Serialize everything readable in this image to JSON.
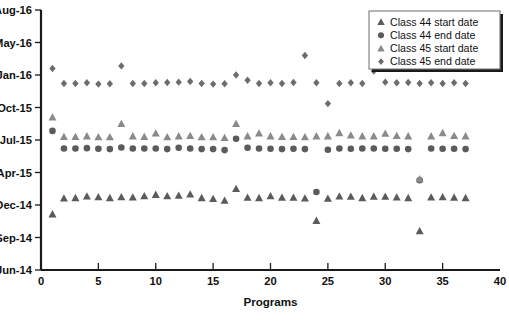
{
  "chart_data": {
    "type": "scatter",
    "title": "",
    "xlabel": "Programs",
    "ylabel": "",
    "xlim": [
      0,
      40
    ],
    "xticks": [
      0,
      5,
      10,
      15,
      20,
      25,
      30,
      35,
      40
    ],
    "xtick_labels": [
      "0",
      "5",
      "10",
      "15",
      "20",
      "25",
      "30",
      "35",
      "40"
    ],
    "yticks": [
      "Jun-14",
      "Sep-14",
      "Dec-14",
      "Apr-15",
      "Jul-15",
      "Oct-15",
      "Jan-16",
      "May-16",
      "Aug-16"
    ],
    "ytick_labels": [
      "Jun-14",
      "Sep-14",
      "Dec-14",
      "Apr-15",
      "Jul-15",
      "Oct-15",
      "Jan-16",
      "May-16",
      "Aug-16"
    ],
    "ylim_index": [
      0,
      8
    ],
    "grid": false,
    "legend_position": "top-right",
    "series": [
      {
        "name": "Class 44 start date",
        "marker": "triangle",
        "color": "#5b5b5b",
        "x": [
          1,
          2,
          3,
          4,
          5,
          6,
          7,
          8,
          9,
          10,
          11,
          12,
          13,
          14,
          15,
          16,
          17,
          18,
          19,
          20,
          21,
          22,
          23,
          24,
          25,
          26,
          27,
          28,
          29,
          30,
          31,
          32,
          33,
          34,
          35,
          36,
          37
        ],
        "y": [
          1.72,
          2.21,
          2.22,
          2.27,
          2.25,
          2.22,
          2.25,
          2.24,
          2.28,
          2.32,
          2.28,
          2.29,
          2.33,
          2.22,
          2.19,
          2.14,
          2.5,
          2.23,
          2.22,
          2.28,
          2.23,
          2.23,
          2.21,
          1.52,
          2.2,
          2.27,
          2.26,
          2.22,
          2.26,
          2.26,
          2.24,
          2.22,
          1.2,
          2.24,
          2.25,
          2.23,
          2.22
        ]
      },
      {
        "name": "Class 44 end date",
        "marker": "circle",
        "color": "#5b5b5b",
        "x": [
          1,
          2,
          3,
          4,
          5,
          6,
          7,
          8,
          9,
          10,
          11,
          12,
          13,
          14,
          15,
          16,
          17,
          18,
          19,
          20,
          21,
          22,
          23,
          24,
          25,
          26,
          27,
          28,
          29,
          30,
          31,
          32,
          33,
          34,
          35,
          36,
          37
        ],
        "y": [
          4.28,
          3.74,
          3.74,
          3.75,
          3.73,
          3.72,
          3.77,
          3.74,
          3.74,
          3.74,
          3.72,
          3.76,
          3.74,
          3.72,
          3.72,
          3.69,
          4.04,
          3.76,
          3.74,
          3.73,
          3.72,
          3.73,
          3.72,
          2.4,
          3.7,
          3.74,
          3.73,
          3.74,
          3.74,
          3.73,
          3.73,
          3.72,
          2.76,
          3.74,
          3.73,
          3.73,
          3.72
        ]
      },
      {
        "name": "Class 45 start date",
        "marker": "triangle",
        "color": "#8a8a8a",
        "x": [
          1,
          2,
          3,
          4,
          5,
          6,
          7,
          8,
          9,
          10,
          11,
          12,
          13,
          14,
          15,
          16,
          17,
          18,
          19,
          20,
          21,
          22,
          23,
          24,
          25,
          26,
          27,
          28,
          29,
          30,
          31,
          32,
          33,
          34,
          35,
          36,
          37
        ],
        "y": [
          4.7,
          4.1,
          4.1,
          4.12,
          4.09,
          4.09,
          4.5,
          4.12,
          4.1,
          4.21,
          4.09,
          4.12,
          4.13,
          4.09,
          4.09,
          4.07,
          4.5,
          4.12,
          4.21,
          4.12,
          4.1,
          4.1,
          4.09,
          4.12,
          4.12,
          4.22,
          4.15,
          4.12,
          4.12,
          4.2,
          4.13,
          4.12,
          2.8,
          4.12,
          4.22,
          4.13,
          4.12
        ]
      },
      {
        "name": "Class 45 end date",
        "marker": "diamond",
        "color": "#6c6c6c",
        "x": [
          1,
          2,
          3,
          4,
          5,
          6,
          7,
          8,
          9,
          10,
          11,
          12,
          13,
          14,
          15,
          16,
          17,
          18,
          19,
          20,
          21,
          22,
          23,
          24,
          25,
          26,
          27,
          28,
          29,
          30,
          31,
          32,
          33,
          34,
          35,
          36,
          37
        ],
        "y": [
          6.2,
          5.74,
          5.74,
          5.76,
          5.72,
          5.73,
          6.28,
          5.74,
          5.74,
          5.76,
          5.77,
          5.78,
          5.8,
          5.74,
          5.72,
          5.73,
          6.0,
          5.84,
          5.74,
          5.76,
          5.74,
          5.77,
          6.6,
          5.76,
          5.12,
          5.74,
          5.76,
          5.74,
          6.12,
          5.78,
          5.76,
          5.77,
          5.74,
          5.76,
          5.74,
          5.76,
          5.74
        ]
      }
    ]
  },
  "legend": {
    "items": [
      {
        "label": "Class 44 start date",
        "marker": "triangle",
        "color": "#5b5b5b"
      },
      {
        "label": "Class 44 end date",
        "marker": "circle",
        "color": "#5b5b5b"
      },
      {
        "label": "Class 45 start date",
        "marker": "triangle",
        "color": "#8a8a8a"
      },
      {
        "label": "Class 45 end date",
        "marker": "diamond",
        "color": "#6c6c6c"
      }
    ]
  },
  "axes": {
    "x_title": "Programs",
    "y_title": ""
  }
}
